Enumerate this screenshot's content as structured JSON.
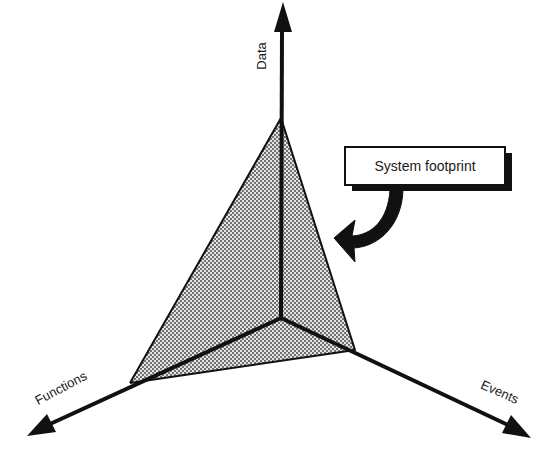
{
  "diagram": {
    "axes": [
      {
        "id": "data",
        "label": "Data"
      },
      {
        "id": "functions",
        "label": "Functions"
      },
      {
        "id": "events",
        "label": "Events"
      }
    ],
    "callout": {
      "label": "System footprint"
    },
    "colors": {
      "line": "#111111",
      "shade_dot": "#333333",
      "shade_bg": "#e6e6e6",
      "background": "#ffffff"
    }
  }
}
